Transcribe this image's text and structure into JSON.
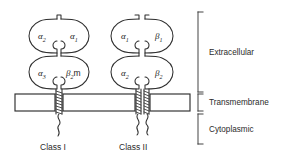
{
  "figure": {
    "background_color": "#ffffff",
    "line_color": "#2e2e2e"
  },
  "class_one": {
    "name": "Class I",
    "label": "Class I",
    "domains": {
      "upper_left": {
        "greek": "α",
        "subscript": "2"
      },
      "upper_right": {
        "greek": "α",
        "subscript": "1"
      },
      "lower_left": {
        "greek": "α",
        "subscript": "3"
      },
      "lower_right": {
        "greek": "β",
        "subscript": "2",
        "suffix": "m"
      }
    },
    "transmembrane_segments": 1,
    "cytoplasmic_tails": 1
  },
  "class_two": {
    "name": "Class II",
    "label": "Class II",
    "domains": {
      "upper_left": {
        "greek": "α",
        "subscript": "1"
      },
      "upper_right": {
        "greek": "β",
        "subscript": "1"
      },
      "lower_left": {
        "greek": "α",
        "subscript": "2"
      },
      "lower_right": {
        "greek": "β",
        "subscript": "2"
      }
    },
    "transmembrane_segments": 2,
    "cytoplasmic_tails": 2
  },
  "regions": [
    {
      "id": "extracellular",
      "label": "Extracellular"
    },
    {
      "id": "transmembrane",
      "label": "Transmembrane"
    },
    {
      "id": "cytoplasmic",
      "label": "Cytoplasmic"
    }
  ]
}
